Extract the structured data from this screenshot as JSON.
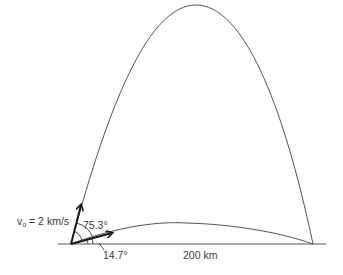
{
  "diagram": {
    "labels": {
      "velocity_symbol": "v",
      "velocity_subscript": "o",
      "velocity_value": " = 2 km/s",
      "high_angle": "75.3°",
      "low_angle": "14.7°",
      "range": "200 km"
    },
    "trajectories": [
      {
        "name": "high-trajectory",
        "launch_angle_deg": 75.3
      },
      {
        "name": "low-trajectory",
        "launch_angle_deg": 14.7
      }
    ],
    "launch_speed": "2 km/s",
    "range": "200 km",
    "colors": {
      "line": "#555555",
      "arrow": "#1a1a1a",
      "text": "#3a3a3a"
    }
  }
}
